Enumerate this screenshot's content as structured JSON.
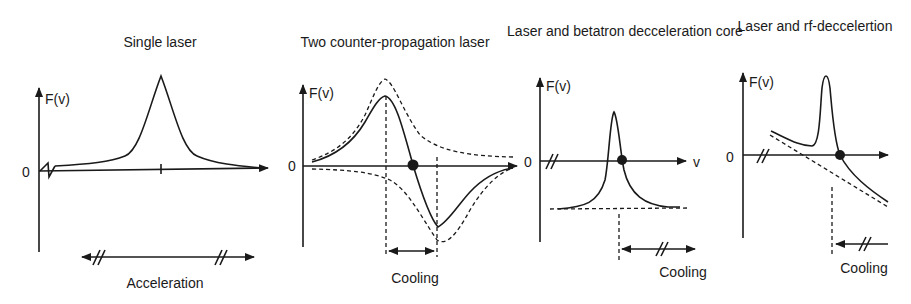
{
  "figure": {
    "panels": [
      {
        "title": "Single laser",
        "y_label": "F(v)",
        "origin_label": "0",
        "x_label": "",
        "range_caption": "Acceleration",
        "curve": "lorentzian-peak",
        "equilibrium_point": false
      },
      {
        "title": "Two counter-propagation laser",
        "y_label": "F(v)",
        "origin_label": "0",
        "x_label": "",
        "range_caption": "Cooling",
        "curve": "dispersive (sum of two opposite lorentzians, dashed components)",
        "equilibrium_point": true
      },
      {
        "title": "Laser and betatron decceleration core",
        "y_label": "F(v)",
        "origin_label": "0",
        "x_label": "v",
        "range_caption": "Cooling",
        "curve": "lorentzian peak on constant negative offset (dashed)",
        "equilibrium_point": true
      },
      {
        "title": "Laser and rf-deccelertion",
        "y_label": "F(v)",
        "origin_label": "0",
        "x_label": "",
        "range_caption": "Cooling",
        "curve": "lorentzian peak on linear decreasing baseline (dashed)",
        "equilibrium_point": true
      }
    ],
    "colors": {
      "ink": "#1a1a1a",
      "background": "#ffffff"
    }
  }
}
